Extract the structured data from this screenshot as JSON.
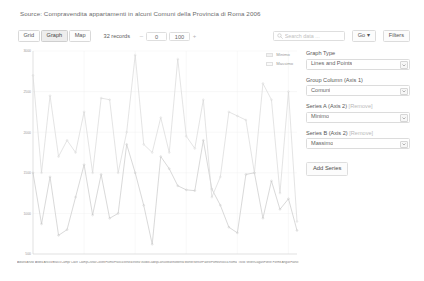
{
  "source": {
    "title": "Source: Compravendita appartamenti in alcuni Comuni della Provincia di Roma 2006"
  },
  "toolbar": {
    "views": [
      {
        "label": "Grid",
        "active": false
      },
      {
        "label": "Graph",
        "active": true
      },
      {
        "label": "Map",
        "active": false
      }
    ],
    "records_label": "32 records",
    "minus_sign": "–",
    "offset_value": "0",
    "limit_value": "100",
    "plus_sign": "+",
    "search_placeholder": "Search data ...",
    "search_value": "",
    "search_icon": "search-icon",
    "go_label": "Go ▾",
    "filters_label": "Filters"
  },
  "panel": {
    "graph_type_label": "Graph Type",
    "graph_type_value": "Lines and Points",
    "group_column_label": "Group Column (Axis 1)",
    "group_column_value": "Comuni",
    "series_a_label": "Series A (Axis 2)",
    "series_a_remove": "[Remove]",
    "series_a_value": "Minimo",
    "series_b_label": "Series B (Axis 2)",
    "series_b_remove": "[Remove]",
    "series_b_value": "Massimo",
    "add_series_label": "Add Series",
    "dropdown_icon": "chevron-down-icon"
  },
  "colors": {
    "series_a": "#c9c9c9",
    "series_b": "#d8d8d8",
    "grid": "#f0f0f0",
    "axis": "#d5d5d5",
    "text": "#6b6b6b"
  },
  "chart_data": {
    "type": "line",
    "title": "",
    "xlabel": "",
    "ylabel": "",
    "ylim": [
      500,
      3000
    ],
    "yticks": [
      500,
      1000,
      1500,
      2000,
      2500,
      3000
    ],
    "grid": true,
    "legend_position": "top-right",
    "categories": [
      "Albano Laziale",
      "Anzio",
      "Ardea",
      "Ariccia",
      "Bracciano",
      "Campagnano di Roma",
      "Cave",
      "Ciampino",
      "Civitavecchia",
      "Colleferro",
      "Fiumicino",
      "Frascati",
      "Genzano di Roma",
      "Grottaferrata",
      "Guidonia",
      "Ladispoli",
      "Lanuvio",
      "Marino",
      "Mentana",
      "Monterotondo",
      "Nettuno",
      "Palestrina",
      "Pomezia",
      "Rocca di Papa",
      "Roma",
      "Tivoli",
      "Velletri",
      "Zagarolo",
      "Fonte Nuova",
      "Formello",
      "Anguillara Sabazia",
      "Fiano Romano"
    ],
    "series": [
      {
        "name": "Minimo",
        "color": "#c9c9c9",
        "values": [
          1500,
          870,
          1450,
          730,
          800,
          1200,
          1600,
          980,
          1480,
          940,
          1000,
          1850,
          1500,
          1100,
          620,
          1700,
          1550,
          1340,
          1290,
          1280,
          1900,
          1300,
          1100,
          830,
          760,
          1480,
          1500,
          940,
          1400,
          1050,
          1180,
          790
        ]
      },
      {
        "name": "Massimo",
        "color": "#d8d8d8",
        "values": [
          2700,
          1500,
          2450,
          1700,
          1900,
          1750,
          2250,
          1500,
          2420,
          2400,
          1500,
          2000,
          2950,
          1850,
          1750,
          2180,
          1750,
          2900,
          1950,
          1800,
          2400,
          1200,
          1450,
          2250,
          2200,
          2150,
          1500,
          2600,
          2400,
          1250,
          2500,
          900
        ]
      }
    ]
  }
}
